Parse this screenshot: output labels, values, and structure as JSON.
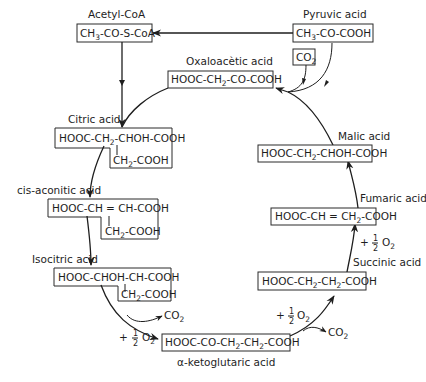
{
  "diagram": {
    "nodes": {
      "acetyl_coa": {
        "name": "Acetyl-CoA",
        "formula": [
          "CH",
          "3",
          "-CO-S-CoA"
        ]
      },
      "pyruvic": {
        "name": "Pyruvic acid",
        "formula": [
          "CH",
          "3",
          "-CO-COOH"
        ]
      },
      "co2_in": {
        "formula": [
          "CO",
          "2"
        ]
      },
      "oxaloacetic": {
        "name": "Oxaloacètic acid",
        "formula": [
          "HOOC-CH",
          "2",
          "-CO-COOH"
        ]
      },
      "citric": {
        "name": "Citric acid",
        "line1": [
          "HOOC-CH",
          "2",
          "-CHOH-COOH"
        ],
        "line2": [
          "CH",
          "2",
          "-COOH"
        ]
      },
      "cis_aconitic": {
        "name": "cis-aconitic acid",
        "line1": "HOOC-CH = CH-COOH",
        "line2": [
          "CH",
          "2",
          "-COOH"
        ]
      },
      "isocitric": {
        "name": "Isocitric acid",
        "line1": "HOOC-CHOH-CH-COOH",
        "line2": [
          "CH",
          "2",
          "-COOH"
        ]
      },
      "alpha_ketoglutaric": {
        "name": "α-ketoglutaric acid",
        "formula": [
          "HOOC-CO-CH",
          "2",
          "-CH",
          "2",
          "-COOH"
        ]
      },
      "succinic": {
        "name": "Succinic acid",
        "formula": [
          "HOOC-CH",
          "2",
          "-CH",
          "2",
          "-COOH"
        ]
      },
      "fumaric": {
        "name": "Fumaric acid",
        "formula": [
          "HOOC-CH = CH",
          "2",
          "-COOH"
        ]
      },
      "malic": {
        "name": "Malic acid",
        "formula": [
          "HOOC-CH",
          "2",
          "-CHOH-COOH"
        ]
      }
    },
    "annotations": {
      "co2_out_1": [
        "CO",
        "2"
      ],
      "co2_out_2": [
        "CO",
        "2"
      ],
      "half_o2_1": {
        "plus": "+",
        "num": "1",
        "den": "2",
        "o": "O",
        "sub": "2"
      },
      "half_o2_2": {
        "plus": "+",
        "num": "1",
        "den": "2",
        "o": "O",
        "sub": "2"
      },
      "half_o2_3": {
        "plus": "+",
        "num": "1",
        "den": "2",
        "o": "O",
        "sub": "2"
      }
    },
    "colors": {
      "ink": "#1e1e1e",
      "background": "#ffffff"
    }
  }
}
